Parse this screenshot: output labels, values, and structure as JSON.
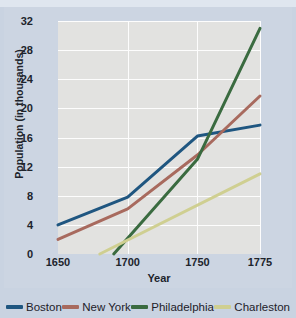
{
  "chart_data": {
    "type": "line",
    "title": "",
    "xlabel": "Year",
    "ylabel": "Population (in thousands)",
    "xlim": [
      1650,
      1775
    ],
    "ylim": [
      0,
      32
    ],
    "xticks": [
      1650,
      1700,
      1750,
      1775
    ],
    "xtick_labels": [
      "1650",
      "1700",
      "1750",
      "1775"
    ],
    "yticks": [
      0,
      4,
      8,
      12,
      16,
      20,
      24,
      28,
      32
    ],
    "ytick_labels": [
      "0",
      "4",
      "8",
      "12",
      "16",
      "20",
      "24",
      "28",
      "32"
    ],
    "grid": true,
    "legend_position": "bottom",
    "plot_background": "#e2e2e0",
    "figure_background": "#ccd5e2",
    "series": [
      {
        "name": "Boston",
        "color": "#1f5680",
        "x": [
          1650,
          1700,
          1750,
          1775
        ],
        "values": [
          4.0,
          7.8,
          16.2,
          17.7
        ]
      },
      {
        "name": "New York",
        "color": "#a86a5e",
        "x": [
          1650,
          1700,
          1750,
          1775
        ],
        "values": [
          2.0,
          6.2,
          13.6,
          21.7
        ]
      },
      {
        "name": "Philadelphia",
        "color": "#3a6b40",
        "x": [
          1690,
          1750,
          1775
        ],
        "values": [
          0.0,
          13.0,
          31.0
        ]
      },
      {
        "name": "Charleston",
        "color": "#cfcf91",
        "x": [
          1680,
          1775
        ],
        "values": [
          0.0,
          11.0
        ]
      }
    ]
  },
  "legend": {
    "items": [
      {
        "label": "Boston",
        "color": "#1f5680",
        "icon": "line-swatch-icon"
      },
      {
        "label": "New York",
        "color": "#a86a5e",
        "icon": "line-swatch-icon"
      },
      {
        "label": "Philadelphia",
        "color": "#3a6b40",
        "icon": "line-swatch-icon"
      },
      {
        "label": "Charleston",
        "color": "#cfcf91",
        "icon": "line-swatch-icon"
      }
    ]
  }
}
